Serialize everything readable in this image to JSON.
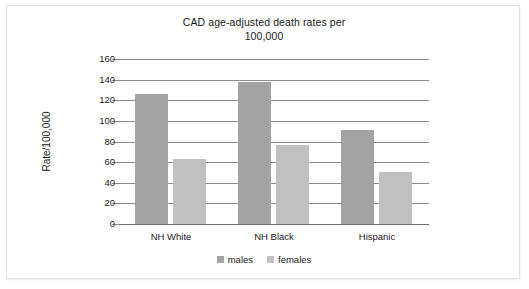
{
  "chart_data": {
    "type": "bar",
    "title": "CAD age-adjusted death rates per 100,000",
    "title_line1": "CAD age-adjusted death rates per",
    "title_line2": "100,000",
    "xlabel": "",
    "ylabel": "Rate/100,000",
    "categories": [
      "NH White",
      "NH Black",
      "Hispanic"
    ],
    "series": [
      {
        "name": "males",
        "values": [
          126,
          138,
          91
        ],
        "color": "#a3a3a3"
      },
      {
        "name": "females",
        "values": [
          63,
          77,
          50
        ],
        "color": "#c0c0c0"
      }
    ],
    "ylim": [
      0,
      160
    ],
    "ytick_step": 20,
    "ytick_labels": [
      "160",
      "140",
      "120",
      "100",
      "80",
      "60",
      "40",
      "20",
      "0"
    ],
    "ytick_values": [
      160,
      140,
      120,
      100,
      80,
      60,
      40,
      20,
      0
    ],
    "grid": true,
    "legend_position": "bottom",
    "legend_entries": [
      "males",
      "females"
    ]
  },
  "legend": {
    "males_label": "males",
    "females_label": "females"
  },
  "colors": {
    "males": "#a3a3a3",
    "females": "#c0c0c0",
    "grid": "#8c8c8c",
    "axis": "#6f6f6f",
    "text": "#1a1a1a",
    "frame_border": "#e0e0e0",
    "background": "#ffffff"
  }
}
